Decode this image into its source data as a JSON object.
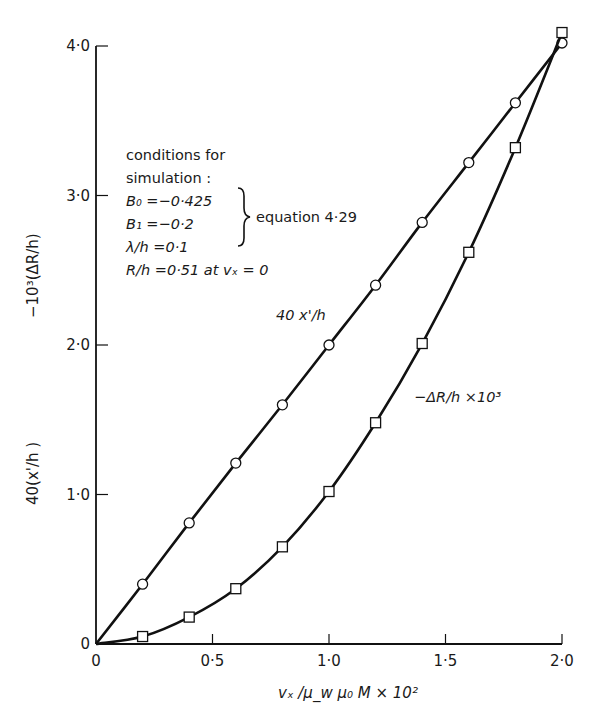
{
  "chart_data": {
    "type": "line",
    "title": "",
    "xlabel": "v_x / μ_w μ_0 M × 10^2",
    "ylabel": "40(x'/h)    −10^3(ΔR/h)",
    "xlim": [
      0,
      2.0
    ],
    "ylim": [
      0,
      4.0
    ],
    "grid": false,
    "x_ticks": [
      0,
      0.5,
      1.0,
      1.5,
      2.0
    ],
    "x_tick_labels": [
      "0",
      "0·5",
      "1·0",
      "1·5",
      "2·0"
    ],
    "y_ticks": [
      0,
      1.0,
      2.0,
      3.0,
      4.0
    ],
    "y_tick_labels": [
      "0",
      "1·0",
      "2·0",
      "3·0",
      "4·0"
    ],
    "x": [
      0,
      0.2,
      0.4,
      0.6,
      0.8,
      1.0,
      1.2,
      1.4,
      1.6,
      1.8,
      2.0
    ],
    "series": [
      {
        "name": "40 x'/h",
        "marker": "circle",
        "values": [
          0,
          0.4,
          0.81,
          1.21,
          1.6,
          2.0,
          2.4,
          2.82,
          3.22,
          3.62,
          4.02
        ]
      },
      {
        "name": "−ΔR/h ×10³",
        "marker": "square",
        "values": [
          0,
          0.05,
          0.18,
          0.37,
          0.65,
          1.02,
          1.48,
          2.01,
          2.62,
          3.32,
          4.09
        ]
      }
    ],
    "annotations": {
      "conditions_heading_1": "conditions for",
      "conditions_heading_2": "simulation:",
      "b0": "B₀ = −0·425",
      "b1": "B₁ = −0·2",
      "brace_label": "equation 4·29",
      "lambda": "λ/h = 0·1",
      "r_over_h": "R/h = 0·51 at vₓ = 0"
    },
    "legend_position": "inline labels on curves"
  },
  "labels": {
    "y_axis_top": "−10³(ΔR/h)",
    "y_axis_bottom": "40(x'/h )",
    "x_axis": "vₓ /μ_w μ₀ M  × 10²",
    "series_circle_label": "40 x'/h",
    "series_square_label": "−ΔR/h ×10³",
    "cond_line1": "conditions for",
    "cond_line2": "simulation :",
    "cond_b0": "B₀ =−0·425",
    "cond_b1": "B₁ =−0·2",
    "cond_eq": "equation 4·29",
    "cond_lambda": "λ/h =0·1",
    "cond_r": "R/h =0·51 at vₓ = 0",
    "origin_y": "0",
    "origin_x": "0"
  },
  "colors": {
    "ink": "#111111",
    "background": "#ffffff"
  }
}
